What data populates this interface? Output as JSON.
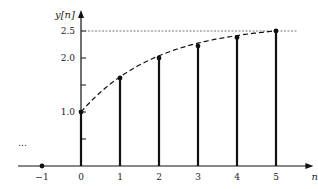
{
  "chart_data": {
    "type": "stem",
    "title": "",
    "xlabel": "n",
    "ylabel": "y[n]",
    "x": [
      -1,
      0,
      1,
      2,
      3,
      4,
      5
    ],
    "values": [
      0,
      1.0,
      1.63,
      2.0,
      2.22,
      2.38,
      2.5
    ],
    "x_ticks": [
      "−1",
      "0",
      "1",
      "2",
      "3",
      "4",
      "5"
    ],
    "y_ticks": [
      "1.0",
      "2.0",
      "2.5"
    ],
    "y_minor_ticks": [
      0.5,
      1.5
    ],
    "ylim": [
      0,
      2.7
    ],
    "xlim": [
      -1.8,
      5.6
    ],
    "annotations": {
      "left_ellipsis": "…",
      "asymptote": 2.5,
      "envelope": "dashed curve through stem tips",
      "asymptote_style": "dotted horizontal line at 2.5"
    },
    "grid": false,
    "legend": null
  },
  "layout": {
    "origin_px": [
      81,
      166
    ],
    "x_step_px": 39,
    "y_unit_px": 54,
    "color": "#111111"
  }
}
